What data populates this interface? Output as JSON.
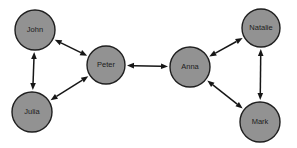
{
  "diagram": {
    "width": 297,
    "height": 148,
    "background": "#ffffff",
    "node_fill": "#929292",
    "node_stroke": "#1f1f1f",
    "edge_color": "#161616",
    "label_color": "#1c1c1c",
    "nodes": [
      {
        "id": "john",
        "label": "John",
        "x": 35,
        "y": 30,
        "r": 20
      },
      {
        "id": "julia",
        "label": "Julia",
        "x": 32,
        "y": 112,
        "r": 20
      },
      {
        "id": "peter",
        "label": "Peter",
        "x": 106,
        "y": 65,
        "r": 19
      },
      {
        "id": "anna",
        "label": "Anna",
        "x": 190,
        "y": 67,
        "r": 20
      },
      {
        "id": "natalie",
        "label": "Natalie",
        "x": 261,
        "y": 28,
        "r": 19
      },
      {
        "id": "mark",
        "label": "Mark",
        "x": 260,
        "y": 122,
        "r": 20
      }
    ],
    "edges": [
      {
        "from": "john",
        "to": "julia",
        "bidirectional": true
      },
      {
        "from": "john",
        "to": "peter",
        "bidirectional": true
      },
      {
        "from": "julia",
        "to": "peter",
        "bidirectional": true
      },
      {
        "from": "peter",
        "to": "anna",
        "bidirectional": true
      },
      {
        "from": "anna",
        "to": "natalie",
        "bidirectional": true
      },
      {
        "from": "anna",
        "to": "mark",
        "bidirectional": true
      },
      {
        "from": "natalie",
        "to": "mark",
        "bidirectional": true
      }
    ]
  }
}
